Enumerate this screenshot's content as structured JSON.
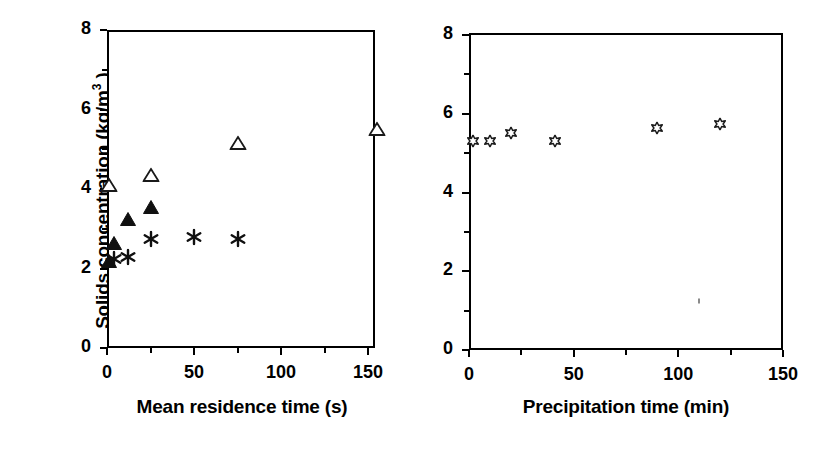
{
  "figure": {
    "y_axis_title_main": "Solids concentration (kg/m",
    "y_axis_title_exponent": "3",
    "y_axis_title_close": " )"
  },
  "chart_data": [
    {
      "id": "left-panel",
      "type": "scatter",
      "title": "",
      "xlabel": "Mean residence time (s)",
      "ylabel": "Solids concentration (kg/m3 )",
      "xlim": [
        0,
        175
      ],
      "ylim": [
        0,
        8
      ],
      "xticks": [
        0,
        50,
        100,
        150
      ],
      "xticklabels": [
        "0",
        "50",
        "100",
        "150"
      ],
      "xminorticks": [
        25,
        75,
        125,
        175
      ],
      "yticks": [
        0,
        2,
        4,
        6,
        8
      ],
      "yticklabels": [
        "0",
        "2",
        "4",
        "6",
        "8"
      ],
      "yminorticks": [
        1,
        3,
        5,
        7
      ],
      "grid": false,
      "legend": "none",
      "series": [
        {
          "name": "open-triangle",
          "marker": "open-triangle",
          "points": [
            {
              "x": 1,
              "y": 4.1
            },
            {
              "x": 25,
              "y": 4.35
            },
            {
              "x": 75,
              "y": 5.15
            },
            {
              "x": 155,
              "y": 5.5
            }
          ]
        },
        {
          "name": "filled-triangle",
          "marker": "filled-triangle",
          "points": [
            {
              "x": 1,
              "y": 2.2
            },
            {
              "x": 4,
              "y": 2.65
            },
            {
              "x": 12,
              "y": 3.25
            },
            {
              "x": 25,
              "y": 3.55
            }
          ]
        },
        {
          "name": "asterisk",
          "marker": "asterisk",
          "points": [
            {
              "x": 4,
              "y": 2.25
            },
            {
              "x": 12,
              "y": 2.3
            },
            {
              "x": 25,
              "y": 2.75
            },
            {
              "x": 50,
              "y": 2.8
            },
            {
              "x": 75,
              "y": 2.75
            }
          ]
        }
      ]
    },
    {
      "id": "right-panel",
      "type": "scatter",
      "title": "",
      "xlabel": "Precipitation time (min)",
      "ylabel": "Solids concentration (kg/m3 )",
      "xlim": [
        0,
        150
      ],
      "ylim": [
        0,
        8
      ],
      "xticks": [
        0,
        50,
        100,
        150
      ],
      "xticklabels": [
        "0",
        "50",
        "100",
        "150"
      ],
      "xminorticks": [
        25,
        75,
        125
      ],
      "yticks": [
        0,
        2,
        4,
        6,
        8
      ],
      "yticklabels": [
        "0",
        "2",
        "4",
        "6",
        "8"
      ],
      "yminorticks": [
        1,
        3,
        5,
        7
      ],
      "grid": false,
      "legend": "none",
      "series": [
        {
          "name": "open-star",
          "marker": "open-star",
          "points": [
            {
              "x": 2,
              "y": 5.3
            },
            {
              "x": 10,
              "y": 5.3
            },
            {
              "x": 20,
              "y": 5.5
            },
            {
              "x": 41,
              "y": 5.3
            },
            {
              "x": 90,
              "y": 5.65
            },
            {
              "x": 120,
              "y": 5.75
            }
          ]
        }
      ]
    }
  ],
  "artifacts": [
    {
      "name": "scan-speck",
      "panel": "right-panel",
      "x": 110,
      "y": 1.25
    }
  ]
}
